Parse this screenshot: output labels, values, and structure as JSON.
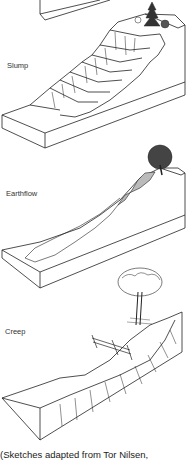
{
  "figures": [
    {
      "label": "Slump",
      "sketch": "slump-block-diagram"
    },
    {
      "label": "Earthflow",
      "sketch": "earthflow-block-diagram"
    },
    {
      "label": "Creep",
      "sketch": "creep-block-diagram"
    }
  ],
  "caption": "(Sketches adapted from Tor Nilsen,"
}
